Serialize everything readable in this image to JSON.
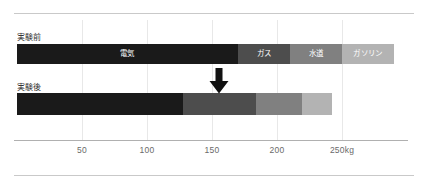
{
  "chart_data": {
    "type": "bar",
    "orientation": "horizontal",
    "stacked": true,
    "title": "",
    "xlabel": "",
    "ylabel": "",
    "xlim": [
      0,
      300
    ],
    "grid": true,
    "legend": "inline-segment-labels",
    "unit": "kg",
    "axis": {
      "ticks": [
        50,
        100,
        150,
        200,
        250
      ],
      "tick_labels": [
        "50",
        "100",
        "150",
        "200",
        "250kg"
      ]
    },
    "categories": [
      "実験前",
      "実験後"
    ],
    "series": [
      {
        "name": "電気",
        "label_visible": true,
        "color": "#1a1a1a",
        "text_color": "#ffffff",
        "values": [
          170,
          128
        ]
      },
      {
        "name": "ガス",
        "label_visible": true,
        "color": "#4d4d4d",
        "text_color": "#ffffff",
        "values": [
          40,
          56
        ]
      },
      {
        "name": "水道",
        "label_visible": true,
        "color": "#808080",
        "text_color": "#ffffff",
        "values": [
          40,
          35
        ]
      },
      {
        "name": "ガソリン",
        "label_visible": true,
        "color": "#b3b3b3",
        "text_color": "#ffffff",
        "values": [
          40,
          23
        ]
      }
    ],
    "annotations": [
      {
        "name": "down-arrow",
        "at_x": 155,
        "meaning": "reduction"
      }
    ]
  },
  "labels": {
    "before": "実験前",
    "after": "実験後",
    "seg_denki": "電気",
    "seg_gas": "ガス",
    "seg_suido": "水道",
    "seg_gasoline": "ガソリン"
  },
  "ticks": {
    "t50": "50",
    "t100": "100",
    "t150": "150",
    "t200": "200",
    "t250": "250kg"
  },
  "colors": {
    "denki": "#1a1a1a",
    "gas": "#4d4d4d",
    "suido": "#808080",
    "gasoline": "#b3b3b3",
    "grid": "#e8e8e8",
    "rule": "#c9c9c9",
    "axis": "#b0b0b0",
    "tick_text": "#6a6a6a",
    "label_text": "#333333",
    "arrow": "#111111"
  }
}
